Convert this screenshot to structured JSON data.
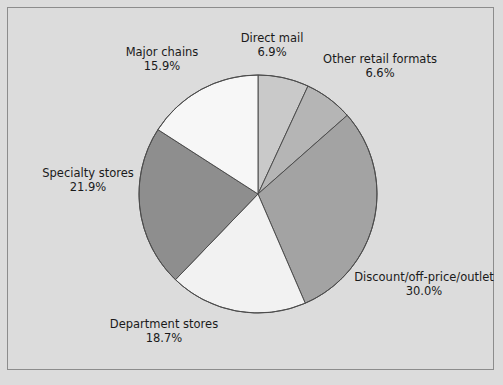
{
  "figure": {
    "background_color": "#dcdcdc",
    "frame_color": "#8c8c8c",
    "text_color": "#1a1a1a"
  },
  "chart_data": {
    "type": "pie",
    "title": "",
    "subtitle": "",
    "xlabel": "",
    "ylabel": "",
    "legend_position": "none",
    "grid": false,
    "start_angle_deg": 90,
    "direction": "clockwise",
    "units": "percent",
    "total": 100.0,
    "center": {
      "x": 258,
      "y": 194
    },
    "radius": 119,
    "categories": [
      "Direct mail",
      "Other retail formats",
      "Discount/off-price/outlet",
      "Department stores",
      "Specialty stores",
      "Major chains"
    ],
    "values": [
      6.9,
      6.6,
      30.0,
      18.7,
      21.9,
      15.9
    ],
    "colors": [
      "#c9c9c9",
      "#b5b5b5",
      "#a3a3a3",
      "#f2f2f2",
      "#8e8e8e",
      "#f7f7f7"
    ],
    "slice_edge_color": "#4d4d4d",
    "slices": [
      {
        "name": "Direct mail",
        "value": 6.9,
        "value_label": "6.9%",
        "color": "#c9c9c9",
        "start_deg": 0.0,
        "end_deg": 24.84
      },
      {
        "name": "Other retail formats",
        "value": 6.6,
        "value_label": "6.6%",
        "color": "#b5b5b5",
        "start_deg": 24.84,
        "end_deg": 48.6
      },
      {
        "name": "Discount/off-price/outlet",
        "value": 30.0,
        "value_label": "30.0%",
        "color": "#a3a3a3",
        "start_deg": 48.6,
        "end_deg": 156.6
      },
      {
        "name": "Department stores",
        "value": 18.7,
        "value_label": "18.7%",
        "color": "#f2f2f2",
        "start_deg": 156.6,
        "end_deg": 223.92
      },
      {
        "name": "Specialty stores",
        "value": 21.9,
        "value_label": "21.9%",
        "color": "#8e8e8e",
        "start_deg": 223.92,
        "end_deg": 302.76
      },
      {
        "name": "Major chains",
        "value": 15.9,
        "value_label": "15.9%",
        "color": "#f7f7f7",
        "start_deg": 302.76,
        "end_deg": 360.0
      }
    ]
  },
  "labels": {
    "direct_mail": {
      "name": "Direct mail",
      "value": "6.9%"
    },
    "other_retail": {
      "name": "Other retail formats",
      "value": "6.6%"
    },
    "discount": {
      "name": "Discount/off-price/outlet",
      "value": "30.0%"
    },
    "department_stores": {
      "name": "Department stores",
      "value": "18.7%"
    },
    "specialty_stores": {
      "name": "Specialty stores",
      "value": "21.9%"
    },
    "major_chains": {
      "name": "Major chains",
      "value": "15.9%"
    }
  }
}
